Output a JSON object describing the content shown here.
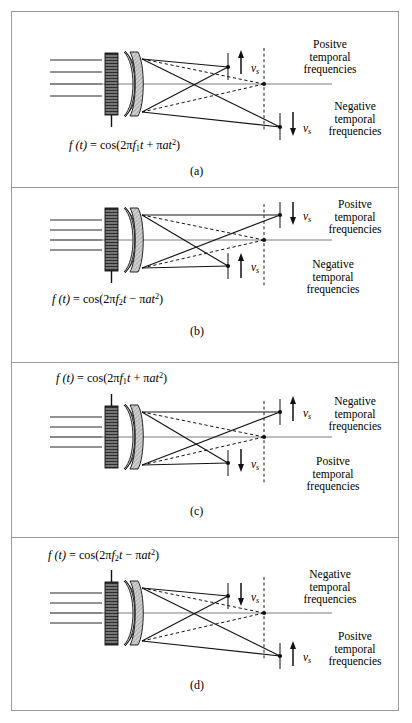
{
  "figure": {
    "name": "acousto-optic-deflector-chirp-diagrams",
    "panel_count": 4
  },
  "symbols": {
    "vs": "v",
    "vs_sub": "s",
    "pi": "π",
    "minus": "−"
  },
  "panels": [
    {
      "id": "a",
      "caption": "(a)",
      "formula": {
        "lhs": "f (t)",
        "eq": "=",
        "fn": "cos(2",
        "pi1": "π",
        "f": "f",
        "fsub": "1",
        "t": "t",
        "sign": "+",
        "pi2": "π",
        "a": "at",
        "exp": "2",
        "close": ")",
        "plain": "f (t) = cos(2πf₁t + πat²)"
      },
      "formula_position": "below-diagram",
      "top_spot": {
        "arrow": "up",
        "label_v": "v",
        "label_sub": "s"
      },
      "bottom_spot": {
        "arrow": "down",
        "label_v": "v",
        "label_sub": "s"
      },
      "top_text": {
        "line1": "Positve",
        "line2": "temporal",
        "line3": "frequencies"
      },
      "bottom_text": {
        "line1": "Negative",
        "line2": "temporal",
        "line3": "frequencies"
      }
    },
    {
      "id": "b",
      "caption": "(b)",
      "formula": {
        "lhs": "f (t)",
        "eq": "=",
        "fn": "cos(2",
        "pi1": "π",
        "f": "f",
        "fsub": "2",
        "t": "t",
        "sign": "−",
        "pi2": "π",
        "a": "at",
        "exp": "2",
        "close": ")",
        "plain": "f (t) = cos(2πf₂t − πat²)"
      },
      "formula_position": "below-diagram",
      "top_spot": {
        "arrow": "down",
        "label_v": "v",
        "label_sub": "s"
      },
      "bottom_spot": {
        "arrow": "up",
        "label_v": "v",
        "label_sub": "s"
      },
      "top_text": {
        "line1": "Positve",
        "line2": "temporal",
        "line3": "frequencies"
      },
      "bottom_text": {
        "line1": "Negative",
        "line2": "temporal",
        "line3": "frequencies"
      }
    },
    {
      "id": "c",
      "caption": "(c)",
      "formula": {
        "lhs": "f (t)",
        "eq": "=",
        "fn": "cos(2",
        "pi1": "π",
        "f": "f",
        "fsub": "1",
        "t": "t",
        "sign": "+",
        "pi2": "π",
        "a": "at",
        "exp": "2",
        "close": ")",
        "plain": "f (t) = cos(2πf₁t + πat²)"
      },
      "formula_position": "above-diagram",
      "top_spot": {
        "arrow": "up",
        "label_v": "v",
        "label_sub": "s"
      },
      "bottom_spot": {
        "arrow": "down",
        "label_v": "v",
        "label_sub": "s"
      },
      "top_text": {
        "line1": "Negative",
        "line2": "temporal",
        "line3": "frequencies"
      },
      "bottom_text": {
        "line1": "Positve",
        "line2": "temporal",
        "line3": "frequencies"
      }
    },
    {
      "id": "d",
      "caption": "(d)",
      "formula": {
        "lhs": "f (t)",
        "eq": "=",
        "fn": "cos(2",
        "pi1": "π",
        "f": "f",
        "fsub": "2",
        "t": "t",
        "sign": "−",
        "pi2": "π",
        "a": "at",
        "exp": "2",
        "close": ")",
        "plain": "f (t) = cos(2πf₂t − πat²)"
      },
      "formula_position": "above-diagram",
      "top_spot": {
        "arrow": "down",
        "label_v": "v",
        "label_sub": "s"
      },
      "bottom_spot": {
        "arrow": "up",
        "label_v": "v",
        "label_sub": "s"
      },
      "top_text": {
        "line1": "Negative",
        "line2": "temporal",
        "line3": "frequencies"
      },
      "bottom_text": {
        "line1": "Positve",
        "line2": "temporal",
        "line3": "frequencies"
      }
    }
  ],
  "colors": {
    "border": "#9a9a9a",
    "ink": "#000000",
    "axis": "#7a7a7a",
    "ray": "#1a1a1a",
    "transducer_dark": "#3a3a3a",
    "lens_fill": "#d8d8d8",
    "crystal_fill": "#c9c9c9",
    "background": "#ffffff"
  }
}
